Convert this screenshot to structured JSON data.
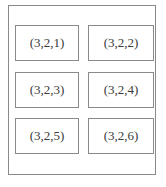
{
  "diagram": {
    "type": "subplot-grid-layout",
    "rows": 3,
    "cols": 2,
    "cells": [
      {
        "label": "(3,2,1)"
      },
      {
        "label": "(3,2,2)"
      },
      {
        "label": "(3,2,3)"
      },
      {
        "label": "(3,2,4)"
      },
      {
        "label": "(3,2,5)"
      },
      {
        "label": "(3,2,6)"
      }
    ],
    "colors": {
      "border": "#8a8a8a",
      "text": "#3a3a3a",
      "background": "#ffffff"
    }
  }
}
